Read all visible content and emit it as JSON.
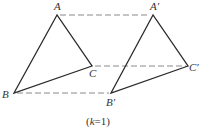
{
  "diagram": {
    "caption": {
      "open": "(",
      "var": "k",
      "rest": "=1)"
    },
    "colors": {
      "edge": "#2a2a2a",
      "dash": "#8a8a8a",
      "text": "#333333",
      "background": "#ffffff"
    },
    "triangles": [
      {
        "name": "ABC",
        "vertices": {
          "A": {
            "x": 57,
            "y": 15,
            "label": "A"
          },
          "B": {
            "x": 14,
            "y": 93,
            "label": "B"
          },
          "C": {
            "x": 92,
            "y": 66,
            "label": "C"
          }
        }
      },
      {
        "name": "A'B'C'",
        "vertices": {
          "A": {
            "x": 153,
            "y": 15,
            "label": "A′"
          },
          "B": {
            "x": 111,
            "y": 93,
            "label": "B′"
          },
          "C": {
            "x": 188,
            "y": 66,
            "label": "C′"
          }
        }
      }
    ],
    "correspondence_lines": [
      {
        "from": "A",
        "to": "A′",
        "style": "dashed"
      },
      {
        "from": "C",
        "to": "C′",
        "style": "dashed"
      },
      {
        "from": "B",
        "to": "B′",
        "style": "dashed"
      }
    ]
  }
}
